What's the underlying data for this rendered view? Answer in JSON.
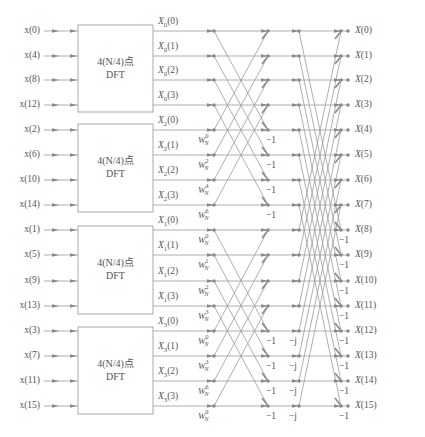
{
  "diagram": {
    "type": "radix-4 decimation-in-time FFT signal flow graph (N=16)",
    "colors": {
      "line": "#9a9a9a",
      "node": "#8a8a8a",
      "text": "#555555",
      "box_border": "#a0a0a0"
    },
    "rows_y": [
      31,
      56,
      80,
      105,
      130,
      155,
      180,
      205,
      230,
      255,
      281,
      306,
      331,
      356,
      381,
      406
    ],
    "inputs": [
      "x(0)",
      "x(4)",
      "x(8)",
      "x(12)",
      "x(2)",
      "x(6)",
      "x(10)",
      "x(14)",
      "x(1)",
      "x(5)",
      "x(9)",
      "x(13)",
      "x(3)",
      "x(7)",
      "x(11)",
      "x(15)"
    ],
    "blocks": [
      {
        "line1": "4(N/4)点",
        "line2": "DFT",
        "y_top": 25,
        "y_bottom": 112
      },
      {
        "line1": "4(N/4)点",
        "line2": "DFT",
        "y_top": 124,
        "y_bottom": 212
      },
      {
        "line1": "4(N/4)点",
        "line2": "DFT",
        "y_top": 226,
        "y_bottom": 314
      },
      {
        "line1": "4(N/4)点",
        "line2": "DFT",
        "y_top": 327,
        "y_bottom": 414
      }
    ],
    "block_outputs": [
      {
        "base": "X",
        "sub": "0",
        "arg": "(0)"
      },
      {
        "base": "X",
        "sub": "0",
        "arg": "(1)"
      },
      {
        "base": "X",
        "sub": "0",
        "arg": "(2)"
      },
      {
        "base": "X",
        "sub": "0",
        "arg": "(3)"
      },
      {
        "base": "X",
        "sub": "2",
        "arg": "(0)"
      },
      {
        "base": "X",
        "sub": "2",
        "arg": "(1)"
      },
      {
        "base": "X",
        "sub": "2",
        "arg": "(2)"
      },
      {
        "base": "X",
        "sub": "2",
        "arg": "(3)"
      },
      {
        "base": "X",
        "sub": "1",
        "arg": "(0)"
      },
      {
        "base": "X",
        "sub": "1",
        "arg": "(1)"
      },
      {
        "base": "X",
        "sub": "1",
        "arg": "(2)"
      },
      {
        "base": "X",
        "sub": "1",
        "arg": "(3)"
      },
      {
        "base": "X",
        "sub": "3",
        "arg": "(0)"
      },
      {
        "base": "X",
        "sub": "3",
        "arg": "(1)"
      },
      {
        "base": "X",
        "sub": "3",
        "arg": "(2)"
      },
      {
        "base": "X",
        "sub": "3",
        "arg": "(3)"
      }
    ],
    "twiddles": [
      null,
      null,
      null,
      null,
      {
        "base": "W",
        "sub": "N",
        "exp": "0"
      },
      {
        "base": "W",
        "sub": "N",
        "exp": "2"
      },
      {
        "base": "W",
        "sub": "N",
        "exp": "4"
      },
      {
        "base": "W",
        "sub": "N",
        "exp": "6"
      },
      {
        "base": "W",
        "sub": "N",
        "exp": "0"
      },
      {
        "base": "W",
        "sub": "N",
        "exp": "1"
      },
      {
        "base": "W",
        "sub": "N",
        "exp": "2"
      },
      {
        "base": "W",
        "sub": "N",
        "exp": "3"
      },
      {
        "base": "W",
        "sub": "N",
        "exp": "0"
      },
      {
        "base": "W",
        "sub": "N",
        "exp": "3"
      },
      {
        "base": "W",
        "sub": "N",
        "exp": "6"
      },
      {
        "base": "W",
        "sub": "N",
        "exp": "9"
      }
    ],
    "stage1_multipliers": [
      "",
      "",
      "",
      "",
      "−1",
      "−1",
      "−1",
      "−1",
      "",
      "",
      "",
      "",
      "−1",
      "−1",
      "−1",
      "−1"
    ],
    "stage2_pre_multipliers": [
      "",
      "",
      "",
      "",
      "",
      "",
      "",
      "",
      "",
      "",
      "",
      "",
      "−j",
      "−j",
      "−j",
      "−j"
    ],
    "stage2_multipliers": [
      "",
      "",
      "",
      "",
      "",
      "",
      "",
      "",
      "−1",
      "−1",
      "−1",
      "−1",
      "−1",
      "−1",
      "−1",
      "−1"
    ],
    "outputs": [
      "X(0)",
      "X(1)",
      "X(2)",
      "X(3)",
      "X(4)",
      "X(5)",
      "X(6)",
      "X(7)",
      "X(8)",
      "X(9)",
      "X(10)",
      "X(11)",
      "X(12)",
      "X(13)",
      "X(14)",
      "X(15)"
    ]
  }
}
